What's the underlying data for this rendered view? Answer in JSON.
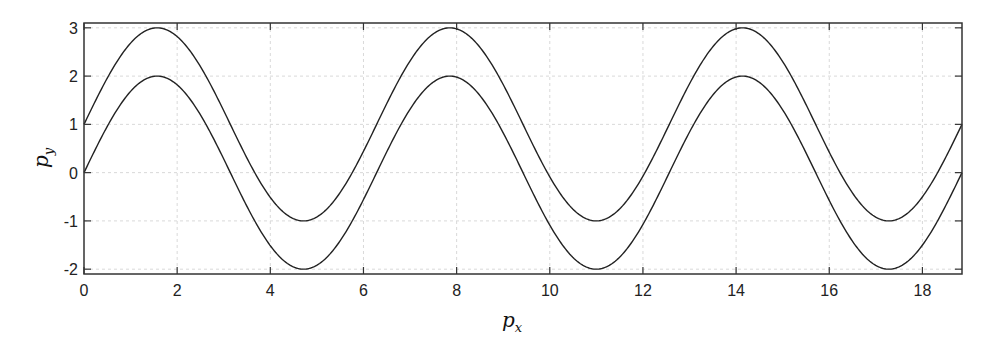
{
  "chart_data": {
    "type": "line",
    "title": "",
    "xlabel": "p_x",
    "ylabel": "p_y",
    "xlabel_main": "p",
    "xlabel_sub": "x",
    "ylabel_main": "p",
    "ylabel_sub": "y",
    "xlim": [
      0,
      18.85
    ],
    "ylim": [
      -2.1,
      3.1
    ],
    "grid": true,
    "legend": null,
    "x_ticks": [
      0,
      2,
      4,
      6,
      8,
      10,
      12,
      14,
      16,
      18
    ],
    "y_ticks": [
      -2,
      -1,
      0,
      1,
      2,
      3
    ],
    "x_tick_labels": [
      "0",
      "2",
      "4",
      "6",
      "8",
      "10",
      "12",
      "14",
      "16",
      "18"
    ],
    "y_tick_labels": [
      "-2",
      "-1",
      "0",
      "1",
      "2",
      "3"
    ],
    "series": [
      {
        "name": "upper curve",
        "description": "1 + 2·sin(p_x)",
        "offset": 1,
        "amplitude": 2,
        "color": "#222222",
        "x": [
          0,
          1.571,
          3.142,
          4.712,
          6.283,
          7.854,
          9.425,
          10.996,
          12.566,
          14.137,
          15.708,
          17.279,
          18.85
        ],
        "y": [
          1,
          3,
          1,
          -1,
          1,
          3,
          1,
          -1,
          1,
          3,
          1,
          -1,
          1
        ]
      },
      {
        "name": "lower curve",
        "description": "2·sin(p_x)",
        "offset": 0,
        "amplitude": 2,
        "color": "#222222",
        "x": [
          0,
          1.571,
          3.142,
          4.712,
          6.283,
          7.854,
          9.425,
          10.996,
          12.566,
          14.137,
          15.708,
          17.279,
          18.85
        ],
        "y": [
          0,
          2,
          0,
          -2,
          0,
          2,
          0,
          -2,
          0,
          2,
          0,
          -2,
          0
        ]
      }
    ]
  },
  "colors": {
    "axis": "#333333",
    "grid": "#d9d9d9",
    "line": "#222222"
  }
}
